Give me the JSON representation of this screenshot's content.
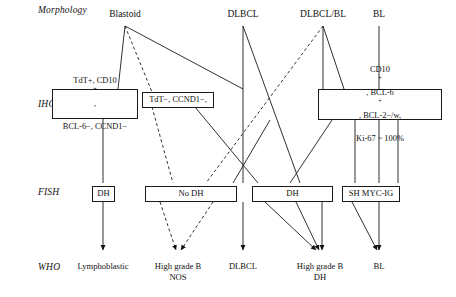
{
  "figure": {
    "background_color": "#ffffff",
    "line_color": "#1a1a1a"
  },
  "row_labels": [
    {
      "id": "morphology",
      "text": "Morphology"
    },
    {
      "id": "ihc",
      "text": "IHC"
    },
    {
      "id": "fish",
      "text": "FISH"
    },
    {
      "id": "who",
      "text": "WHO"
    }
  ],
  "morphology": {
    "items": [
      {
        "id": "blastoid",
        "label": "Blastoid"
      },
      {
        "id": "dlbcl",
        "label": "DLBCL"
      },
      {
        "id": "dlbcl-bl",
        "label": "DLBCL/BL"
      },
      {
        "id": "bl",
        "label": "BL"
      }
    ]
  },
  "ihc": {
    "boxes": [
      {
        "id": "ihc-tdt-positive",
        "line1_prefix": "TdT+, CD10",
        "line1_sup": "+",
        "line1_suffix": ",",
        "line2": "BCL-6−, CCND1−"
      },
      {
        "id": "ihc-tdt-negative",
        "line1": "TdT−, CCND1−,"
      },
      {
        "id": "ihc-germinal-center",
        "line1_a": "CD10",
        "line1_a_sup": "+",
        "line1_b": ", BCL-6",
        "line1_b_sup": "+",
        "line1_c": ", BCL-2−/w,",
        "line2": "Ki-67 ~ 100%"
      }
    ]
  },
  "fish": {
    "boxes": [
      {
        "id": "fish-dh-left",
        "label": "DH"
      },
      {
        "id": "fish-no-dh",
        "label": "No DH"
      },
      {
        "id": "fish-dh-right",
        "label": "DH"
      },
      {
        "id": "fish-sh-myc-ig",
        "label": "SH MYC-IG"
      }
    ]
  },
  "who": {
    "items": [
      {
        "id": "who-lymphoblastic",
        "line1": "Lymphoblastic",
        "line2": ""
      },
      {
        "id": "who-high-grade-b-nos",
        "line1": "High grade B",
        "line2": "NOS"
      },
      {
        "id": "who-dlbcl",
        "line1": "DLBCL",
        "line2": ""
      },
      {
        "id": "who-high-grade-b-dh",
        "line1": "High grade B",
        "line2": "DH"
      },
      {
        "id": "who-bl",
        "line1": "BL",
        "line2": ""
      }
    ]
  }
}
